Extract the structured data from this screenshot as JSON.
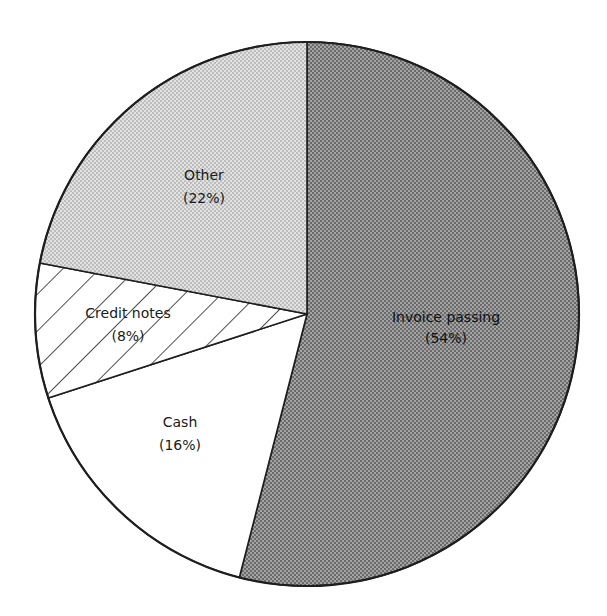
{
  "chart_data": {
    "type": "pie",
    "title": "",
    "categories": [
      "Invoice passing",
      "Cash",
      "Credit notes",
      "Other"
    ],
    "values": [
      54,
      16,
      8,
      22
    ],
    "unit": "%",
    "start_angle_deg": 0,
    "direction": "clockwise",
    "legend": "none (labels inside slices)",
    "slices": [
      {
        "label": "Invoice passing",
        "pct_text": "(54%)",
        "value": 54,
        "fill": "dark-halftone",
        "color": "#8c8c8c"
      },
      {
        "label": "Cash",
        "pct_text": "(16%)",
        "value": 16,
        "fill": "white",
        "color": "#ffffff"
      },
      {
        "label": "Credit notes",
        "pct_text": "(8%)",
        "value": 8,
        "fill": "diagonal-hatch",
        "color": "#ffffff"
      },
      {
        "label": "Other",
        "pct_text": "(22%)",
        "value": 22,
        "fill": "light-halftone",
        "color": "#d2d2d2"
      }
    ]
  }
}
